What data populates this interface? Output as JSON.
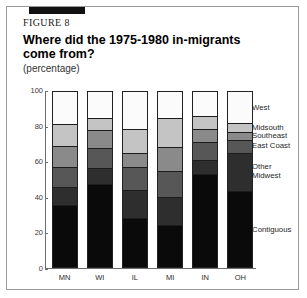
{
  "figure": {
    "label": "FIGURE 8",
    "title": "Where did the 1975-1980 in-migrants come from?",
    "subtitle": "(percentage)"
  },
  "chart_data": {
    "type": "bar",
    "subtype": "stacked-bar-100",
    "title": "Where did the 1975-1980 in-migrants come from?",
    "subtitle": "(percentage)",
    "xlabel": "",
    "ylabel": "",
    "ylim": [
      0,
      100
    ],
    "yticks": [
      "0",
      "20",
      "40",
      "60",
      "80",
      "100"
    ],
    "grid": false,
    "legend_position": "right",
    "categories": [
      "MN",
      "WI",
      "IL",
      "MI",
      "IN",
      "OH"
    ],
    "series": [
      {
        "name": "Contiguous",
        "color": "#0a0a0a",
        "values": [
          36,
          48,
          28,
          24,
          54,
          44
        ]
      },
      {
        "name": "Other Midwest",
        "color": "#2e2e2e",
        "values": [
          10,
          9,
          16,
          16,
          8,
          22
        ]
      },
      {
        "name": "East Coast",
        "color": "#575757",
        "values": [
          11,
          11,
          13,
          15,
          10,
          7
        ]
      },
      {
        "name": "Southeast",
        "color": "#8a8a8a",
        "values": [
          12,
          10,
          8,
          13,
          7,
          4
        ]
      },
      {
        "name": "Midsouth",
        "color": "#c4c4c4",
        "values": [
          12,
          7,
          13,
          17,
          7,
          5
        ]
      },
      {
        "name": "West",
        "color": "#fbfbfb",
        "values": [
          19,
          15,
          22,
          15,
          14,
          18
        ]
      }
    ]
  },
  "legend": {
    "items": [
      {
        "label": "West"
      },
      {
        "label": "Midsouth"
      },
      {
        "label": "Southeast"
      },
      {
        "label": "East Coast"
      },
      {
        "label": "Other\nMidwest"
      },
      {
        "label": "Contiguous"
      }
    ]
  }
}
